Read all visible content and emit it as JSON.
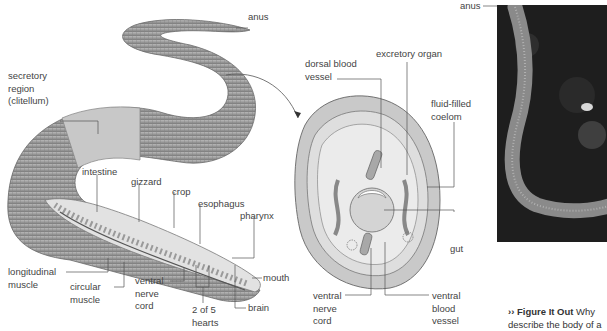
{
  "figure": {
    "whole_worm_labels": {
      "anus": "anus",
      "clitellum": "secretory\nregion\n(clitellum)",
      "intestine": "intestine",
      "gizzard": "gizzard",
      "crop": "crop",
      "esophagus": "esophagus",
      "pharynx": "pharynx",
      "mouth": "mouth",
      "longitudinal_muscle": "longitudinal\nmuscle",
      "circular_muscle": "circular\nmuscle",
      "ventral_nerve_cord": "ventral\nnerve\ncord",
      "hearts": "2 of 5\nhearts",
      "brain": "brain"
    },
    "cross_section_labels": {
      "dorsal_blood_vessel": "dorsal blood\nvessel",
      "excretory_organ": "excretory organ",
      "coelom": "fluid-filled\ncoelom",
      "gut": "gut",
      "ventral_nerve_cord": "ventral\nnerve\ncord",
      "ventral_blood_vessel": "ventral\nblood\nvessel"
    },
    "photo_labels": {
      "anus": "anus"
    },
    "caption": {
      "prefix": "›› Figure It Out",
      "text_line1": "Why",
      "text_line2": "describe the body of a"
    },
    "colors": {
      "worm_body": "#9a9a9a",
      "clitellum": "#c4c4c4",
      "section_fill": "#d0d0d0",
      "photo_bg": "#1c1c1c",
      "label_text": "#444444"
    }
  }
}
